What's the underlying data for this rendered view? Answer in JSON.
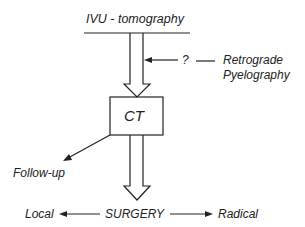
{
  "diagram": {
    "top_label": "IVU - tomography",
    "side_question": "?",
    "side_label_line1": "Retrograde",
    "side_label_line2": "Pyelography",
    "box_label": "CT",
    "follow_up_label": "Follow-up",
    "center_label": "SURGERY",
    "left_label": "Local",
    "right_label": "Radical",
    "stroke_color": "#222222"
  }
}
